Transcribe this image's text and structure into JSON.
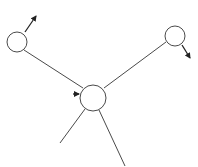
{
  "diagram": {
    "type": "node-link",
    "background": "#ffffff",
    "stroke_color": "#4a4a4a",
    "arrow_color": "#222222",
    "nodes": [
      {
        "id": "left-node",
        "cx": 17,
        "cy": 42,
        "r": 10
      },
      {
        "id": "right-node",
        "cx": 175,
        "cy": 36,
        "r": 10
      },
      {
        "id": "center-node",
        "cx": 93,
        "cy": 98,
        "r": 13
      }
    ],
    "edges": [
      {
        "id": "left-to-center",
        "x1": 24,
        "y1": 50,
        "x2": 83,
        "y2": 88
      },
      {
        "id": "right-to-center",
        "x1": 166,
        "y1": 42,
        "x2": 104,
        "y2": 88
      },
      {
        "id": "center-to-bottom-left",
        "x1": 85,
        "y1": 109,
        "x2": 60,
        "y2": 143
      },
      {
        "id": "center-to-bottom-right",
        "x1": 99,
        "y1": 110,
        "x2": 125,
        "y2": 166
      }
    ],
    "arrows": [
      {
        "id": "left-node-arrow",
        "x1": 25,
        "y1": 32,
        "x2": 36,
        "y2": 16
      },
      {
        "id": "right-node-arrow",
        "x1": 182,
        "y1": 45,
        "x2": 190,
        "y2": 58
      },
      {
        "id": "center-node-arrow",
        "x1": 73,
        "y1": 94,
        "x2": 79,
        "y2": 94
      }
    ]
  }
}
